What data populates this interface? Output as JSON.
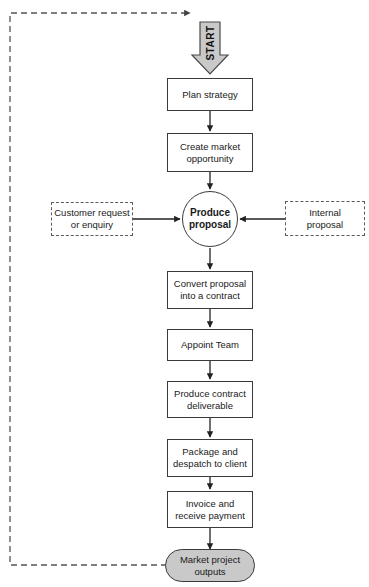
{
  "diagram": {
    "background_color": "#ffffff",
    "stroke_color": "#3a3a3a",
    "fill_gray": "#c9c9c9",
    "start": {
      "label": "START",
      "shape": "block-arrow-down",
      "fill": "#c9c9c9"
    },
    "steps": [
      {
        "id": "plan-strategy",
        "label": "Plan strategy"
      },
      {
        "id": "create-market-opportunity",
        "label": "Create market\nopportunity"
      },
      {
        "id": "produce-proposal",
        "label": "Produce\nproposal"
      },
      {
        "id": "convert-proposal",
        "label": "Convert proposal\ninto a contract"
      },
      {
        "id": "appoint-team",
        "label": "Appoint Team"
      },
      {
        "id": "produce-contract-deliverable",
        "label": "Produce contract\ndeliverable"
      },
      {
        "id": "package-despatch",
        "label": "Package and\ndespatch to client"
      },
      {
        "id": "invoice-receive-payment",
        "label": "Invoice and\nreceive payment"
      },
      {
        "id": "market-project-outputs",
        "label": "Market project\noutputs"
      }
    ],
    "inputs": [
      {
        "id": "customer-request",
        "label": "Customer request\nor enquiry",
        "side": "left"
      },
      {
        "id": "internal-proposal",
        "label": "Internal\nproposal",
        "side": "right"
      }
    ],
    "feedback_loop": {
      "from": "market-project-outputs",
      "to": "start",
      "style": "dashed"
    }
  }
}
